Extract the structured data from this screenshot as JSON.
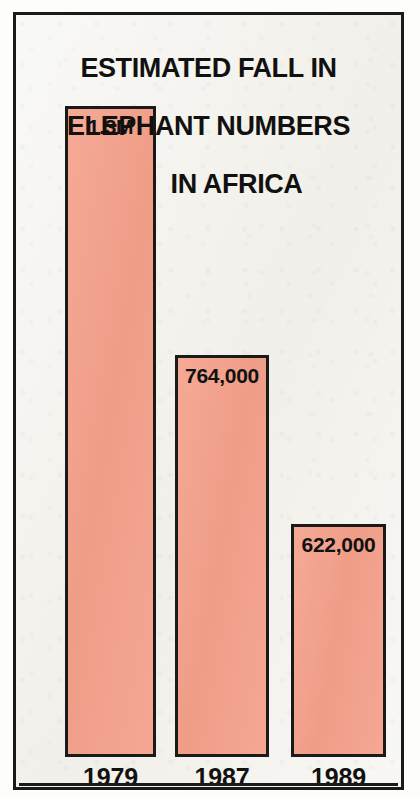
{
  "chart_data": {
    "type": "bar",
    "title": "ESTIMATED FALL IN ELEPHANT NUMBERS IN AFRICA",
    "title_lines": [
      "ESTIMATED FALL IN",
      "ELEPHANT NUMBERS",
      "IN AFRICA"
    ],
    "xlabel": "",
    "ylabel": "",
    "categories": [
      "1979",
      "1987",
      "1989"
    ],
    "values": [
      1300000,
      764000,
      622000
    ],
    "value_labels": [
      "1.3M",
      "764,000",
      "622,000"
    ],
    "ylim": [
      0,
      1300000
    ],
    "grid": false,
    "legend": false,
    "bar_color": "#f4a08a",
    "bar_outline_color": "#1a1a18",
    "background_color": "#f2f1ec",
    "text_color": "#111110",
    "bars": [
      {
        "category": "1979",
        "value": 1300000,
        "label": "1.3M",
        "left": 49,
        "width": 91,
        "top": 91,
        "height": 651
      },
      {
        "category": "1987",
        "value": 764000,
        "label": "764,000",
        "left": 159,
        "width": 94,
        "top": 340,
        "height": 402
      },
      {
        "category": "1989",
        "value": 622000,
        "label": "622,000",
        "left": 275,
        "width": 95,
        "top": 509,
        "height": 233
      }
    ],
    "year_label_positions": [
      {
        "left": 49,
        "width": 91,
        "top": 748
      },
      {
        "left": 159,
        "width": 94,
        "top": 748
      },
      {
        "left": 275,
        "width": 95,
        "top": 748
      }
    ],
    "baseline_rule_y": 768
  }
}
